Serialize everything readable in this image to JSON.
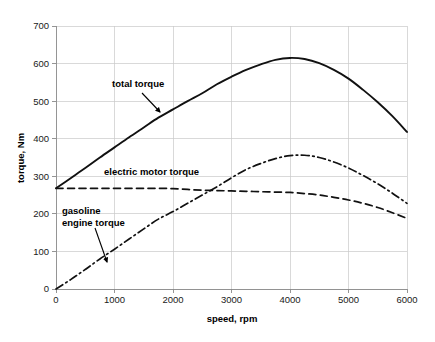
{
  "chart_data": {
    "type": "line",
    "title": "",
    "xlabel": "speed, rpm",
    "ylabel": "torque, Nm",
    "xlim": [
      0,
      6000
    ],
    "ylim": [
      0,
      700
    ],
    "xticks": [
      0,
      1000,
      2000,
      3000,
      4000,
      5000,
      6000
    ],
    "yticks": [
      0,
      100,
      200,
      300,
      400,
      500,
      600,
      700
    ],
    "xtick_labels": [
      "0",
      "1000",
      "2000",
      "3000",
      "4000",
      "5000",
      "6000"
    ],
    "ytick_labels": [
      "0",
      "100",
      "200",
      "300",
      "400",
      "500",
      "600",
      "700"
    ],
    "grid": true,
    "legend": "none (inline annotations with leader arrows)",
    "x": [
      0,
      250,
      500,
      750,
      1000,
      1250,
      1500,
      1750,
      2000,
      2250,
      2500,
      2750,
      3000,
      3250,
      3500,
      3750,
      4000,
      4250,
      4500,
      4750,
      5000,
      5250,
      5500,
      5750,
      6000
    ],
    "series": [
      {
        "name": "total torque",
        "style": "solid",
        "color": "#111111",
        "values": [
          268,
          295,
          322,
          350,
          377,
          404,
          430,
          456,
          478,
          500,
          521,
          545,
          565,
          583,
          598,
          610,
          615,
          612,
          601,
          583,
          560,
          530,
          497,
          460,
          418
        ]
      },
      {
        "name": "electric motor torque",
        "style": "dashed",
        "color": "#333333",
        "values": [
          268,
          268,
          268,
          268,
          268,
          268,
          268,
          268,
          267,
          265,
          263,
          262,
          261,
          260,
          259,
          258,
          257,
          254,
          250,
          244,
          237,
          228,
          217,
          203,
          188
        ]
      },
      {
        "name": "gasoline engine torque",
        "style": "dash-dot",
        "color": "#333333",
        "values": [
          0,
          25,
          52,
          80,
          106,
          133,
          160,
          186,
          206,
          228,
          250,
          272,
          296,
          318,
          334,
          347,
          355,
          356,
          350,
          338,
          322,
          302,
          280,
          255,
          228
        ]
      }
    ],
    "annotations": [
      {
        "name": "total-torque-label",
        "text": "total torque",
        "label_x": 112,
        "label_y": 87,
        "arrow_from": [
          142,
          93
        ],
        "arrow_to": [
          160,
          112
        ]
      },
      {
        "name": "electric-motor-torque-label",
        "text": "electric motor torque",
        "label_x": 104,
        "label_y": 175,
        "arrow_from": null,
        "arrow_to": null
      },
      {
        "name": "gasoline-engine-torque-label-line1",
        "text": "gasoline",
        "label_x": 62,
        "label_y": 214,
        "arrow_from": [
          95,
          228
        ],
        "arrow_to": [
          107,
          262
        ]
      },
      {
        "name": "gasoline-engine-torque-label-line2",
        "text": "engine torque",
        "label_x": 62,
        "label_y": 226
      }
    ]
  },
  "axes": {
    "x_title": "speed, rpm",
    "y_title": "torque, Nm"
  },
  "colors": {
    "background": "#ffffff",
    "grid": "#c9c9c9",
    "axis": "#8a8a8a",
    "total_torque": "#111111",
    "electric_motor_torque": "#333333",
    "gasoline_engine_torque": "#333333",
    "text": "#000000"
  }
}
